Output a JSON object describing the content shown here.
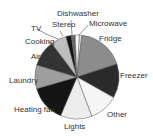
{
  "chart_data": {
    "type": "pie",
    "title": "",
    "center": [
      77,
      77
    ],
    "radius": 42,
    "slices": [
      {
        "label": "Microwave",
        "value": 1,
        "color": "#e8e8e8",
        "lx": 89,
        "ly": 26
      },
      {
        "label": "Fridge",
        "value": 18,
        "color": "#8c8c8c",
        "lx": 99,
        "ly": 41
      },
      {
        "label": "Freezer",
        "value": 13,
        "color": "#2b2b2b",
        "lx": 120,
        "ly": 78
      },
      {
        "label": "Other",
        "value": 11,
        "color": "#f5f5f5",
        "lx": 107,
        "ly": 117
      },
      {
        "label": "Lights",
        "value": 12,
        "color": "#ececec",
        "lx": 64,
        "ly": 129
      },
      {
        "label": "Heating fan",
        "value": 14,
        "color": "#141414",
        "lx": 14,
        "ly": 112
      },
      {
        "label": "Laundry",
        "value": 9,
        "color": "#9e9e9e",
        "lx": 9,
        "ly": 83
      },
      {
        "label": "Air",
        "value": 10,
        "color": "#333333",
        "lx": 31,
        "ly": 59
      },
      {
        "label": "Cooking",
        "value": 6,
        "color": "#bdbdbd",
        "lx": 25,
        "ly": 44
      },
      {
        "label": "TV",
        "value": 2,
        "color": "#111111",
        "lx": 31,
        "ly": 31
      },
      {
        "label": "Stereo",
        "value": 1.5,
        "color": "#6a6a6a",
        "lx": 52,
        "ly": 27
      },
      {
        "label": "Dishwasher",
        "value": 1.5,
        "color": "#fafafa",
        "lx": 57,
        "ly": 16
      }
    ]
  }
}
